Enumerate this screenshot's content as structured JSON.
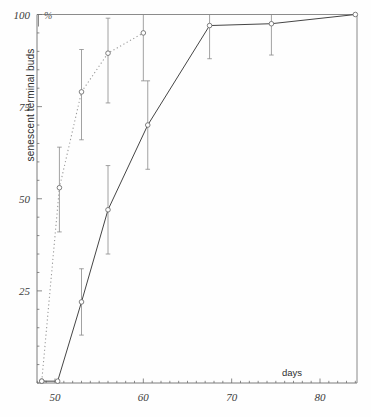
{
  "chart_data": {
    "type": "line",
    "title": "",
    "xlabel": "days",
    "ylabel": "senescent terminal buds",
    "yunit": "%",
    "xlim": [
      46.5,
      84.5
    ],
    "ylim": [
      0,
      100
    ],
    "grid": false,
    "legend": "none",
    "xticks": [
      50,
      60,
      70,
      80
    ],
    "xtick_labels": [
      "50",
      "60",
      "70",
      "80"
    ],
    "yticks": [
      25,
      50,
      75,
      100
    ],
    "ytick_labels": [
      "25",
      "50",
      "75",
      "100"
    ],
    "series": [
      {
        "name": "dotted-series",
        "style": "dotted",
        "marker": "open-circle",
        "x": [
          48.5,
          50.5,
          53.0,
          56.0,
          60.0
        ],
        "values": [
          0.5,
          53.0,
          79.0,
          89.5,
          95.0
        ],
        "errors_low": [
          0.5,
          41.0,
          66.0,
          76.0,
          82.0
        ],
        "errors_high": [
          0.5,
          64.0,
          90.5,
          99.0,
          100.0
        ]
      },
      {
        "name": "solid-series",
        "style": "solid",
        "marker": "open-circle",
        "x": [
          48.5,
          50.3,
          53.0,
          56.0,
          60.5,
          67.5,
          74.5,
          84.0
        ],
        "values": [
          0.5,
          0.5,
          22.0,
          47.0,
          70.0,
          97.0,
          97.5,
          100.0
        ],
        "errors_low": [
          0.5,
          0.5,
          13.0,
          35.0,
          58.0,
          88.0,
          89.0,
          100.0
        ],
        "errors_high": [
          0.5,
          0.5,
          31.0,
          59.0,
          82.0,
          100.0,
          100.0,
          100.0
        ]
      }
    ]
  },
  "axes": {
    "x_axis_title": "days",
    "y_axis_title": "senescent terminal buds",
    "y_unit_symbol": "%",
    "x_tick_labels": [
      "50",
      "60",
      "70",
      "80"
    ],
    "y_tick_labels": [
      "100",
      "75",
      "50",
      "25"
    ]
  },
  "colors": {
    "axis": "#6d6d6d",
    "solid_line": "#454545",
    "dotted_line": "#9a9a9a",
    "marker_stroke": "#707070",
    "errorbar": "#8a8a8a",
    "text": "#333333",
    "background": "#fefefe"
  }
}
